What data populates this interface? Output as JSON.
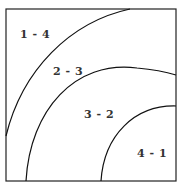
{
  "diagram": {
    "regions": [
      {
        "label": "1 - 4"
      },
      {
        "label": "2 - 3"
      },
      {
        "label": "3 - 2"
      },
      {
        "label": "4 - 1"
      }
    ]
  }
}
